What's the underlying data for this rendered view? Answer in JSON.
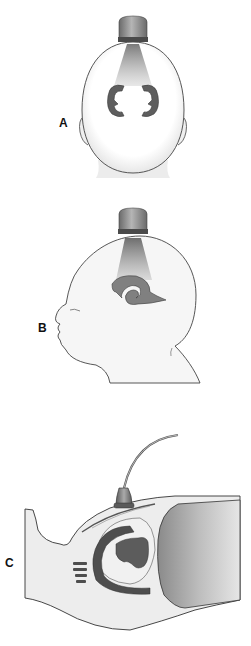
{
  "figure": {
    "panels": [
      {
        "id": "A",
        "label": "A",
        "view": "coronal view, probe on anterior fontanelle, head from behind"
      },
      {
        "id": "B",
        "label": "B",
        "view": "sagittal view, infant head in profile with probe on top"
      },
      {
        "id": "C",
        "label": "C",
        "view": "cross-section with probe and cable on skin surface over ventricles"
      }
    ]
  },
  "colors": {
    "outline": "#333333",
    "skin": "#f4f4f4",
    "beam": "#8a8a8a",
    "ventricle": "#5a5a5a",
    "probe": "#8c8c8c",
    "dark_mass": "#9a9a9a"
  }
}
